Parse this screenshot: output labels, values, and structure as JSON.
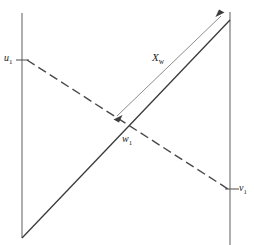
{
  "figure": {
    "type": "geometry-diagram",
    "background_color": "#ffffff",
    "labels": {
      "u1": {
        "base": "u",
        "sub": "1"
      },
      "v1": {
        "base": "v",
        "sub": "1"
      },
      "w1": {
        "base": "w",
        "sub": "1"
      },
      "xw": {
        "base": "X",
        "sub": "w"
      }
    },
    "colors": {
      "axis": "#6b6b6b",
      "solid_diagonal": "#3a3a3a",
      "dashed_diagonal": "#4a4a4a",
      "dimension": "#6f6f6f",
      "text": "#1b1b1b"
    },
    "geometry": {
      "left_axis": {
        "x": 22,
        "y_top": 13,
        "y_bottom": 238
      },
      "right_axis": {
        "x": 230,
        "y_top": 12,
        "y_bottom": 245
      },
      "u1_tick": {
        "x1": 17,
        "y1": 60,
        "x2": 28,
        "y2": 60
      },
      "v1_tick": {
        "x1": 226,
        "y1": 189,
        "x2": 238,
        "y2": 189
      },
      "solid_diagonal": {
        "x1": 22,
        "y1": 238,
        "x2": 230,
        "y2": 20
      },
      "dashed_diagonal": {
        "x1": 27,
        "y1": 60,
        "x2": 228,
        "y2": 189
      },
      "intersection_w1": {
        "x": 130,
        "y": 133
      },
      "dimension_line": {
        "x1": 115,
        "y1": 118,
        "x2": 223,
        "y2": 14
      }
    }
  }
}
